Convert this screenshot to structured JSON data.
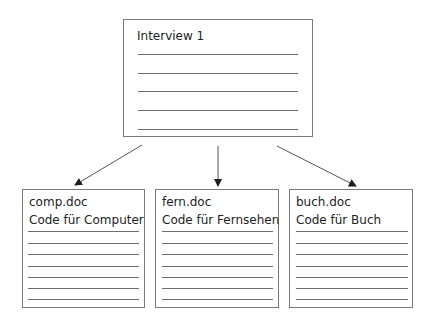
{
  "diagram": {
    "type": "document-split",
    "source": {
      "title": "Interview 1",
      "line_count": 5
    },
    "targets": [
      {
        "filename": "comp.doc",
        "code": "Code für Computer",
        "line_count": 7
      },
      {
        "filename": "fern.doc",
        "code": "Code für Fernsehen",
        "line_count": 7
      },
      {
        "filename": "buch.doc",
        "code": "Code für Buch",
        "line_count": 7
      }
    ],
    "edges": [
      {
        "from": "Interview 1",
        "to": "comp.doc"
      },
      {
        "from": "Interview 1",
        "to": "fern.doc"
      },
      {
        "from": "Interview 1",
        "to": "buch.doc"
      }
    ],
    "colors": {
      "border": "#7a7a7a",
      "line": "#6f6f6f",
      "arrow": "#2a2a2a",
      "text": "#222222"
    }
  }
}
